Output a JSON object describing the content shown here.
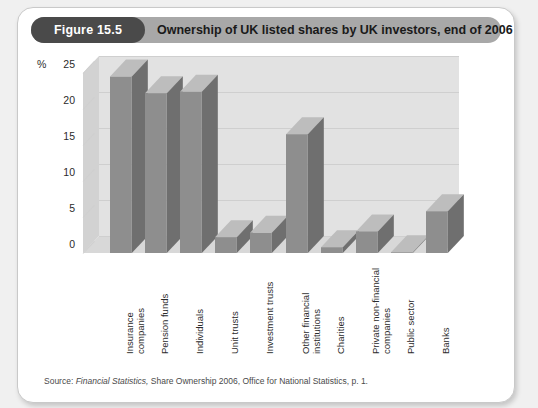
{
  "figure": {
    "number_label": "Figure 15.5",
    "title": "Ownership of UK listed shares by UK investors, end of 2006",
    "source_prefix": "Source:",
    "source_italic": "Financial Statistics,",
    "source_rest": "Share Ownership 2006, Office for National Statistics, p. 1."
  },
  "colors": {
    "pill_bg": "#4a4a4a",
    "header_bg": "#a8a8a8",
    "bar_front": "#8e8e8e",
    "bar_top": "#bdbdbd",
    "bar_side": "#6f6f6f",
    "wall": "#e2e2e2",
    "gridline": "#cfcfcf",
    "card_bg": "#ffffff",
    "page_bg": "#f0f0f0"
  },
  "chart_data": {
    "type": "bar",
    "title": "Ownership of UK listed shares by UK investors, end of 2006",
    "xlabel": "",
    "ylabel": "%",
    "ylim": [
      0,
      25
    ],
    "yticks": [
      0,
      5,
      10,
      15,
      20,
      25
    ],
    "grid": true,
    "legend": "none",
    "three_d": true,
    "categories": [
      "Insurance companies",
      "Pension funds",
      "Individuals",
      "Unit trusts",
      "Investment trusts",
      "Other financial institutions",
      "Charities",
      "Private non-financial companies",
      "Public sector",
      "Banks"
    ],
    "category_lines": [
      [
        "Insurance",
        "companies"
      ],
      [
        "Pension funds"
      ],
      [
        "Individuals"
      ],
      [
        "Unit trusts"
      ],
      [
        "Investment trusts"
      ],
      [
        "Other financial",
        "institutions"
      ],
      [
        "Charities"
      ],
      [
        "Private non-financial",
        "companies"
      ],
      [
        "Public sector"
      ],
      [
        "Banks"
      ]
    ],
    "values": [
      24.5,
      22.2,
      22.4,
      2.2,
      2.8,
      16.5,
      0.8,
      3.0,
      0.1,
      5.8
    ],
    "units": "percent"
  }
}
